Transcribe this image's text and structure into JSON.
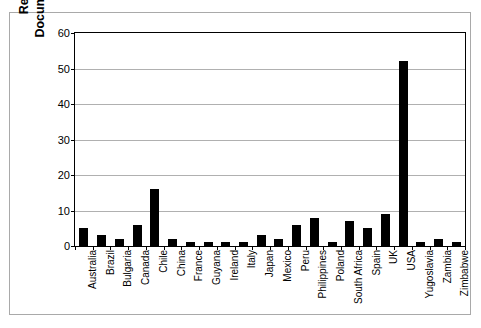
{
  "chart_data": {
    "type": "bar",
    "title": "",
    "xlabel": "",
    "ylabel": "Reported and Documented Failures",
    "ylabel_lines": [
      "Reported and",
      "Documented Failures"
    ],
    "ylim": [
      0,
      60
    ],
    "yticks": [
      0,
      10,
      20,
      30,
      40,
      50,
      60
    ],
    "ytick_labels": [
      "0",
      "10",
      "20",
      "30",
      "40",
      "50",
      "60"
    ],
    "grid": "horizontal",
    "legend": "none",
    "bar_color": "#000000",
    "categories": [
      "Australia",
      "Brazil",
      "Bulgaria",
      "Canada",
      "Chile",
      "China",
      "France",
      "Guyana",
      "Ireland",
      "Italy",
      "Japan",
      "Mexico",
      "Peru",
      "Philippines",
      "Poland",
      "South Africa",
      "Spain",
      "UK",
      "USA",
      "Yugoslavia",
      "Zambia",
      "Zimbabwe"
    ],
    "values": [
      5,
      3,
      2,
      6,
      16,
      2,
      1,
      1,
      1,
      1,
      3,
      2,
      6,
      8,
      1,
      7,
      5,
      9,
      52,
      1,
      2,
      1
    ]
  }
}
